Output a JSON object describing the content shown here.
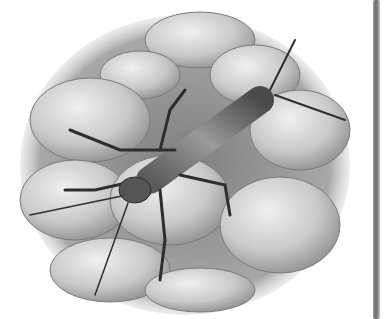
{
  "image": {
    "subject": "stonefly nymph on rocks",
    "style": "grayscale pencil illustration",
    "colors": {
      "background": "#ffffff",
      "rock_light": "#d9d9d9",
      "rock_mid": "#b0b0b0",
      "gravel": "#8c8c8c",
      "insect_dark": "#3c3c3c",
      "edge_bar": "#7a7a7a"
    }
  }
}
